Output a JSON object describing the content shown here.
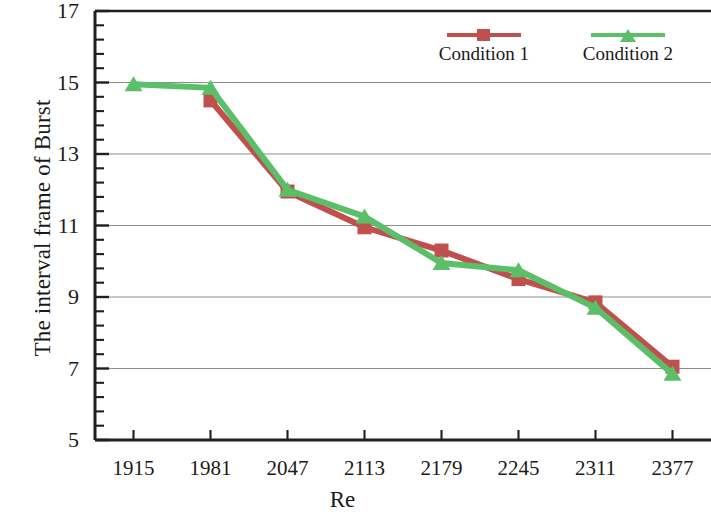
{
  "chart_data": {
    "type": "line",
    "title": "",
    "xlabel": "Re",
    "ylabel": "The interval frame of Burst",
    "categories": [
      "1915",
      "1981",
      "2047",
      "2113",
      "2179",
      "2245",
      "2311",
      "2377"
    ],
    "x": [
      1915,
      1981,
      2047,
      2113,
      2179,
      2245,
      2311,
      2377
    ],
    "xlim": [
      1882,
      2410
    ],
    "ylim": [
      5,
      17
    ],
    "y_major_ticks": [
      5,
      7,
      9,
      11,
      13,
      15,
      17
    ],
    "y_tick_labels": [
      "5",
      "7",
      "9",
      "11",
      "13",
      "15",
      "17"
    ],
    "y_minor_tick_step": 0.4,
    "grid": "horizontal-major",
    "legend_position": "top-right-inside",
    "series": [
      {
        "name": "Condition 1",
        "color": "#c0504d",
        "marker": "square",
        "values": [
          null,
          14.5,
          11.95,
          10.95,
          10.3,
          9.5,
          8.85,
          7.05
        ]
      },
      {
        "name": "Condition 2",
        "color": "#5bbf6a",
        "marker": "triangle",
        "values": [
          14.95,
          14.85,
          12.0,
          11.25,
          9.95,
          9.75,
          8.7,
          6.85
        ]
      }
    ]
  },
  "legend": {
    "entries": [
      {
        "label": "Condition 1"
      },
      {
        "label": "Condition 2"
      }
    ]
  },
  "axes": {
    "x_title": "Re",
    "y_title": "The interval frame of Burst"
  },
  "colors": {
    "series_1": "#c0504d",
    "series_2": "#5bbf6a",
    "axis": "#1f1f1f",
    "grid": "#8d8d8d",
    "background": "#ffffff"
  }
}
